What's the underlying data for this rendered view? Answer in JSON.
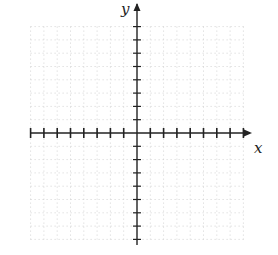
{
  "figure": {
    "type": "blank coordinate grid",
    "x_axis_label": "x",
    "y_axis_label": "y",
    "colors": {
      "background": "#ffffff",
      "axis": "#222222",
      "grid": "#c8c8c8"
    }
  },
  "geometry": {
    "origin": [
      137,
      133
    ],
    "unit_px": 13.3,
    "grid": {
      "x_min": -8,
      "x_max": 8,
      "y_min": -8,
      "y_max": 8
    },
    "x_axis": {
      "from": 31,
      "to": 250,
      "y": 133,
      "arrow_right": true
    },
    "y_axis": {
      "from": 245,
      "to": 4,
      "x": 137,
      "arrow_up": true
    }
  }
}
